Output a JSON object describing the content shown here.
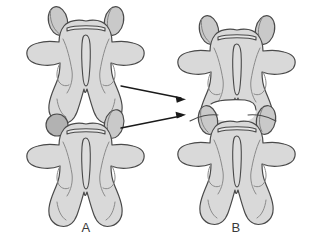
{
  "figure": {
    "background_color": "#ffffff",
    "view": "posterior",
    "panels": [
      {
        "id": "A",
        "label": "A",
        "label_x": 86,
        "label_y": 232,
        "description": "Two separated vertebrae shown individually",
        "specimen_count": 2
      },
      {
        "id": "B",
        "label": "B",
        "label_x": 236,
        "label_y": 232,
        "description": "The two vertebrae articulated together as a motion segment",
        "specimen_count": 2
      }
    ],
    "arrows": [
      {
        "id": "arrow-upper",
        "from_x": 121,
        "from_y": 86,
        "to_x": 185,
        "to_y": 99,
        "direction": "right",
        "meaning": "upper vertebra moves into assembly"
      },
      {
        "id": "arrow-lower",
        "from_x": 121,
        "from_y": 128,
        "to_x": 185,
        "to_y": 115,
        "direction": "right",
        "meaning": "lower vertebra moves into assembly"
      }
    ],
    "colors": {
      "bone_fill": "#d9d9d9",
      "bone_fill_light": "#e2e2e2",
      "facet_fill": "#c9c9c9",
      "facet_fill_dark": "#b2b2b2",
      "outline": "#4a4a4a",
      "inner_line": "#7a7a7a",
      "arrow": "#1a1a1a",
      "label_text": "#3a3a3a",
      "background": "#ffffff"
    },
    "anatomy_parts": [
      "superior articular process",
      "vertebral body margin",
      "transverse process",
      "lamina",
      "spinous process",
      "inferior articular process",
      "vertebral foramen"
    ]
  }
}
